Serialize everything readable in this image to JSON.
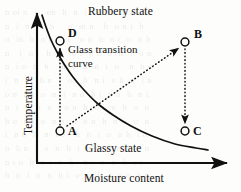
{
  "figure": {
    "kind": "glass-transition-state-diagram",
    "background_color": "#fdfdfb",
    "ink_color": "#111111"
  },
  "axes": {
    "x": {
      "label": "Moisture content",
      "origin_px": [
        37,
        163
      ],
      "end_px": [
        227,
        163
      ],
      "arrow": true
    },
    "y": {
      "label": "Temperature",
      "origin_px": [
        37,
        163
      ],
      "end_px": [
        37,
        13
      ],
      "arrow": true
    }
  },
  "regions": [
    {
      "name": "rubbery",
      "label": "Rubbery state",
      "position_px": [
        88,
        6
      ]
    },
    {
      "name": "glassy",
      "label": "Glassy state",
      "position_px": [
        85,
        143
      ]
    }
  ],
  "curve": {
    "name": "glass-transition-curve",
    "label_line1": "Glass transition",
    "label_line2": "curve",
    "label_position_px": [
      68,
      44
    ],
    "style": "solid",
    "stroke_width": 1.7,
    "path_points_px": [
      [
        42,
        15
      ],
      [
        46,
        27
      ],
      [
        51,
        40
      ],
      [
        57,
        52
      ],
      [
        64,
        64
      ],
      [
        73,
        77
      ],
      [
        84,
        90
      ],
      [
        97,
        103
      ],
      [
        113,
        115
      ],
      [
        131,
        126
      ],
      [
        152,
        136
      ],
      [
        175,
        144
      ],
      [
        196,
        148
      ],
      [
        208,
        150
      ]
    ]
  },
  "points": [
    {
      "id": "D",
      "label": "D",
      "center_px": [
        60,
        41
      ],
      "label_px": [
        68,
        28
      ],
      "marker": "open-circle"
    },
    {
      "id": "A",
      "label": "A",
      "center_px": [
        60,
        131
      ],
      "label_px": [
        68,
        125
      ],
      "marker": "open-circle"
    },
    {
      "id": "B",
      "label": "B",
      "center_px": [
        185,
        42
      ],
      "label_px": [
        194,
        28
      ],
      "marker": "open-circle"
    },
    {
      "id": "C",
      "label": "C",
      "center_px": [
        185,
        131
      ],
      "label_px": [
        193,
        125
      ],
      "marker": "open-circle"
    }
  ],
  "arrows": [
    {
      "id": "A-to-D",
      "from": "A",
      "to": "D",
      "style": "dotted",
      "from_px": [
        60,
        125
      ],
      "to_px": [
        60,
        48
      ]
    },
    {
      "id": "A-to-B",
      "from": "A",
      "to": "B",
      "style": "dotted",
      "from_px": [
        67,
        126
      ],
      "to_px": [
        179,
        48
      ]
    },
    {
      "id": "B-to-C",
      "from": "B",
      "to": "C",
      "style": "dotted",
      "from_px": [
        185,
        49
      ],
      "to_px": [
        185,
        124
      ]
    }
  ],
  "bleed_text": "n oi n  i   on  h  n  i   o  h   n o\nn  i  n  in  h    o  in n   h  o n i  h\no  in  h  n o  n i   o n  h  n i  o  n h\nn   i  o    h  n   o i  n h  o  n  i  o n\nn  i o  n  h   in  o  h  n  i  o   n  h o\ni  n  o   h n  i  on  h  n i  o h  n  i n\no n  i h  o  n  i  n o  h i  n o  h  n i\nn  i  o  h  n  i o n  h  o i  n  h  o  n\nh o  n i  o  n h   i  o n  h  n  i  o  n\ni  n o  h  n  i o   h  n  i  o  n h  i o\no  h n  i  o  n  h  i  n  o  h n  i  o n\nn i o  h  n i  o  h   n i  o  n  h  i o\nh  n  i  o  n  h i  o  n  h  i  n o  h n"
}
